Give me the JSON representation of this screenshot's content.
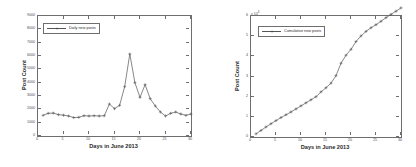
{
  "figure": {
    "background": "#ffffff",
    "line_color": "#555555",
    "axis_color": "#6e6e6e"
  },
  "chart_data": [
    {
      "type": "line",
      "panel": "left",
      "title": "",
      "xlabel": "Days in June 2013",
      "ylabel": "Post Count",
      "legend": [
        "Daily new posts"
      ],
      "legend_position": "upper left",
      "grid": false,
      "marker": "+",
      "xlim": [
        0,
        30
      ],
      "ylim": [
        0,
        9000
      ],
      "xticks": [
        0,
        5,
        10,
        15,
        20,
        25,
        30
      ],
      "xticklabels": [
        "0",
        "5",
        "10",
        "15",
        "20",
        "25",
        "30"
      ],
      "yticks": [
        0,
        1000,
        2000,
        3000,
        4000,
        5000,
        6000,
        7000,
        8000,
        9000
      ],
      "yticklabels": [
        "0",
        "1000",
        "2000",
        "3000",
        "4000",
        "5000",
        "6000",
        "7000",
        "8000",
        "9000"
      ],
      "series": [
        {
          "name": "Daily new posts",
          "x": [
            1,
            2,
            3,
            4,
            5,
            6,
            7,
            8,
            9,
            10,
            11,
            12,
            13,
            14,
            15,
            16,
            17,
            18,
            19,
            20,
            21,
            22,
            23,
            24,
            25,
            26,
            27,
            28,
            29,
            30
          ],
          "values": [
            1550,
            1700,
            1720,
            1600,
            1560,
            1500,
            1380,
            1400,
            1520,
            1500,
            1520,
            1500,
            1520,
            2400,
            2050,
            2300,
            3700,
            6150,
            4000,
            2900,
            3850,
            2800,
            2250,
            1800,
            1500,
            1700,
            1800,
            1650,
            1550,
            1650
          ]
        }
      ]
    },
    {
      "type": "line",
      "panel": "right",
      "title": "",
      "xlabel": "Days in June 2013",
      "ylabel": "Post Count",
      "legend": [
        "Cumulative new posts"
      ],
      "legend_position": "upper left",
      "grid": false,
      "marker": "+",
      "y_exponent": "x 10",
      "y_exponent_power": "4",
      "xlim": [
        0,
        30
      ],
      "ylim": [
        0,
        60000
      ],
      "xticks": [
        0,
        5,
        10,
        15,
        20,
        25,
        30
      ],
      "xticklabels": [
        "0",
        "5",
        "10",
        "15",
        "20",
        "25",
        "30"
      ],
      "yticks": [
        0,
        10000,
        20000,
        30000,
        40000,
        50000,
        60000
      ],
      "yticklabels": [
        "0",
        "1",
        "2",
        "3",
        "4",
        "5",
        "6"
      ],
      "series": [
        {
          "name": "Cumulative new posts",
          "x": [
            1,
            2,
            3,
            4,
            5,
            6,
            7,
            8,
            9,
            10,
            11,
            12,
            13,
            14,
            15,
            16,
            17,
            18,
            19,
            20,
            21,
            22,
            23,
            24,
            25,
            26,
            27,
            28,
            29,
            30
          ],
          "values": [
            1550,
            3250,
            4970,
            6570,
            8130,
            9630,
            11010,
            12410,
            13930,
            15430,
            16950,
            18450,
            19970,
            22370,
            24420,
            26720,
            30420,
            36570,
            40570,
            43470,
            47320,
            50120,
            52370,
            54170,
            55670,
            57370,
            59170,
            60820,
            62370,
            64020
          ]
        }
      ]
    }
  ]
}
